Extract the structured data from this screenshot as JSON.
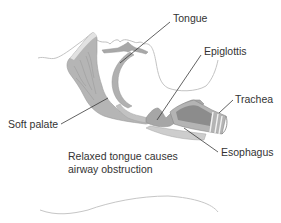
{
  "diagram": {
    "labels": {
      "tongue": "Tongue",
      "epiglottis": "Epiglottis",
      "trachea": "Trachea",
      "soft_palate": "Soft palate",
      "esophagus": "Esophagus"
    },
    "caption": {
      "line1": "Relaxed tongue causes",
      "line2": "airway obstruction"
    },
    "colors": {
      "tissue_fill": "#b8b8b8",
      "tissue_dark": "#8f8f8f",
      "tissue_light": "#d4d4d4",
      "outline": "#c8c8c8",
      "leader_line": "#3a3a3a",
      "text": "#333333"
    }
  }
}
